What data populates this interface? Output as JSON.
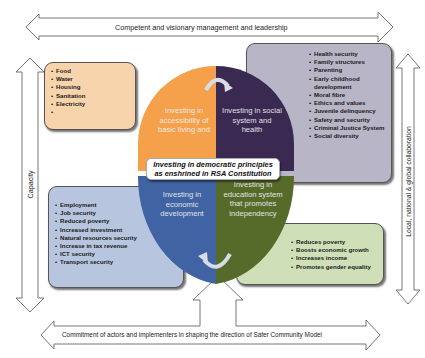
{
  "arrows": {
    "top": "Competent and visionary management and leadership",
    "bottom": "Commitment of actors and implementers in shaping the direction of Safer Community Model",
    "left": "Capacity",
    "right": "Local, national & global collaboration"
  },
  "quadrants": {
    "top_left": {
      "label": "Investing in accessibility of basic living and",
      "color": "#f5a04a"
    },
    "top_right": {
      "label": "Investing in social system and health",
      "color": "#3a2a52"
    },
    "bottom_left": {
      "label": "Investing in economic development",
      "color": "#3f63a3"
    },
    "bottom_right": {
      "label": "Investing in education system that promotes independency",
      "color": "#566b2a"
    }
  },
  "center": {
    "line1": "Investing in democratic principles",
    "line2": "as enshrined in RSA Constitution"
  },
  "boxes": {
    "basic_living": {
      "color": "#f8d4ac",
      "items": [
        "Food",
        "Water",
        "Housing",
        "Sanitation",
        "Electricity",
        ""
      ]
    },
    "social": {
      "color": "#b8b5c6",
      "items": [
        "Health security",
        "Family structures",
        "Parenting",
        "Early childhood development",
        "Moral fibre",
        "Ethics and values",
        "Juvenile delinquency",
        "Safety and security",
        "Criminal Justice System",
        "Social diversity"
      ]
    },
    "economic": {
      "color": "#b7c6de",
      "items": [
        "Employment",
        "Job security",
        "Reduced poverty",
        "Increased investment",
        "Natural resources security",
        "Increase in tax revenue",
        "ICT security",
        "Transport security"
      ]
    },
    "education": {
      "color": "#cfe0b8",
      "items": [
        "Reduces poverty",
        "Boosts economic growth",
        "Increases income",
        "Promotes gender equality"
      ]
    }
  }
}
